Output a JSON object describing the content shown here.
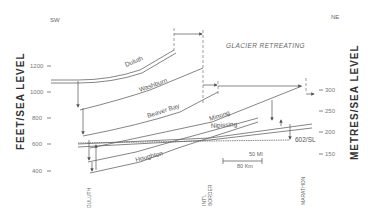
{
  "directions": {
    "left": "SW",
    "right": "NE"
  },
  "note": "GLACIER RETREATING",
  "left_axis": {
    "title": "FEET/SEA LEVEL",
    "ticks": [
      "1200",
      "1000",
      "800",
      "600",
      "400"
    ]
  },
  "right_axis": {
    "title": "METRES/SEA LEVEL",
    "ticks": [
      "300",
      "250",
      "200",
      "150"
    ]
  },
  "lake_levels": [
    "Duluth",
    "Washburn",
    "Beaver Bay",
    "Minong",
    "Nipissing",
    "Houghton"
  ],
  "current_level_label": "602/SL",
  "scale_bar": {
    "top": "50 MI",
    "bottom": "80 Km"
  },
  "places": [
    "DULUTH",
    "INT'L BORDER",
    "MARATHON"
  ],
  "colors": {
    "line": "#666666",
    "text": "#555555",
    "background": "#ffffff"
  }
}
